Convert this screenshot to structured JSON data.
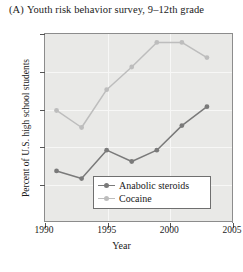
{
  "figure": {
    "panel_letter": "(A)",
    "title": "Youth risk behavior survey, 9–12th grade"
  },
  "colors": {
    "series_anabolic_steroids": "#7a7a7a",
    "series_cocaine": "#bdbdbd",
    "plot_background": "#e9e9e7",
    "axis": "#8c8c8c",
    "gridline": "#f7f7f6",
    "text": "#1a1a1a"
  },
  "chart_data": {
    "type": "line",
    "title": "Youth risk behavior survey, 9–12th grade",
    "xlabel": "Year",
    "ylabel": "Percent of U.S. high school students",
    "xlim": [
      1990,
      2005
    ],
    "ylim": [
      0,
      10
    ],
    "xticks": [
      1990,
      1995,
      2000,
      2005
    ],
    "yticks": [
      2,
      4,
      6,
      8,
      10
    ],
    "xtick_labels": [
      "1990",
      "1995",
      "2000",
      "2005"
    ],
    "ytick_labels": [
      "2",
      "4",
      "6",
      "8",
      "10"
    ],
    "grid": true,
    "legend_position": "inside bottom-center",
    "x": [
      1991,
      1993,
      1995,
      1997,
      1999,
      2001,
      2003
    ],
    "series": [
      {
        "name": "Anabolic steroids",
        "color": "#7a7a7a",
        "values": [
          2.7,
          2.3,
          3.8,
          3.2,
          3.8,
          5.1,
          6.1
        ]
      },
      {
        "name": "Cocaine",
        "color": "#bdbdbd",
        "values": [
          5.9,
          5.0,
          7.0,
          8.2,
          9.5,
          9.5,
          8.7
        ]
      }
    ]
  },
  "legend": {
    "items": [
      {
        "label": "Anabolic steroids"
      },
      {
        "label": "Cocaine"
      }
    ]
  }
}
